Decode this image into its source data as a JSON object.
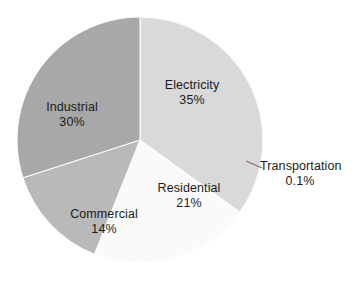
{
  "chart_data": {
    "type": "pie",
    "title": "",
    "subtitle": "",
    "xlabel": "",
    "ylabel": "",
    "legend_position": "none",
    "grid": false,
    "labels_on_slices": true,
    "categories": [
      "Electricity",
      "Transportation",
      "Residential",
      "Commercial",
      "Industrial"
    ],
    "values": [
      35,
      0.1,
      21,
      14,
      30
    ],
    "value_suffix": "%",
    "slices": [
      {
        "name": "Electricity",
        "value": 35,
        "value_text": "35%",
        "color": "#d9d9d9",
        "label_placement": "inside"
      },
      {
        "name": "Transportation",
        "value": 0.1,
        "value_text": "0.1%",
        "color": "#e8e8e8",
        "label_placement": "outside-leader"
      },
      {
        "name": "Residential",
        "value": 21,
        "value_text": "21%",
        "color": "#fafafa",
        "label_placement": "inside"
      },
      {
        "name": "Commercial",
        "value": 14,
        "value_text": "14%",
        "color": "#b9b9b9",
        "label_placement": "inside"
      },
      {
        "name": "Industrial",
        "value": 30,
        "value_text": "30%",
        "color": "#a8a8a8",
        "label_placement": "inside"
      }
    ],
    "start_angle_deg": 0,
    "direction": "clockwise",
    "center": {
      "x": 140,
      "y": 140
    },
    "radius": 123,
    "background": "#ffffff",
    "outline_color": "#ffffff"
  },
  "labels": {
    "electricity": {
      "name": "Electricity",
      "value": "35%"
    },
    "industrial": {
      "name": "Industrial",
      "value": "30%"
    },
    "residential": {
      "name": "Residential",
      "value": "21%"
    },
    "commercial": {
      "name": "Commercial",
      "value": "14%"
    },
    "transportation": {
      "name": "Transportation",
      "value": "0.1%"
    }
  }
}
